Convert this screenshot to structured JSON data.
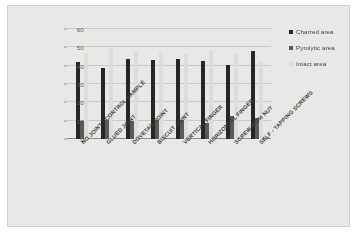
{
  "chart_data": {
    "type": "bar",
    "title": "",
    "xlabel": "",
    "ylabel": "Area (%)",
    "ylim": [
      0,
      60
    ],
    "ytick_values": [
      60,
      50,
      40,
      30,
      20,
      10,
      0
    ],
    "grid": true,
    "legend_position": "right",
    "categories": [
      "NO JOINT - CONTROL SAMPLE",
      "GLUED JOINT",
      "DOVETAIL JOINT",
      "BISCUIT JOINT",
      "VERTICAL FINGER",
      "HORIZONTAL FINGER",
      "SCREW WITH NUT",
      "SELF - TAPPING SCREWS"
    ],
    "series": [
      {
        "name": "Charred area",
        "color": "#262626",
        "values": [
          42.0,
          39.0,
          43.5,
          43.2,
          43.8,
          42.8,
          40.5,
          48.2
        ]
      },
      {
        "name": "Pyrolytic area",
        "color": "#5a5a58",
        "values": [
          10.0,
          10.3,
          9.8,
          10.2,
          10.4,
          8.8,
          12.4,
          11.2
        ]
      },
      {
        "name": "Intact area",
        "color": "#dcdcda",
        "values": [
          47.0,
          49.8,
          48.0,
          47.2,
          46.2,
          48.5,
          47.0,
          41.8
        ]
      }
    ]
  }
}
